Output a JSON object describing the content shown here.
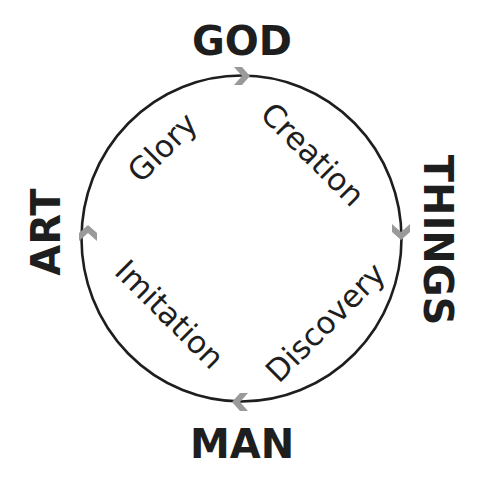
{
  "diagram": {
    "type": "cycle",
    "colors": {
      "line": "#1e1e1e",
      "arrow": "#9a9a9a",
      "text": "#1e1e1e",
      "background": "#ffffff"
    },
    "nodes": [
      {
        "id": "god",
        "label": "GOD",
        "position": "top"
      },
      {
        "id": "things",
        "label": "THINGS",
        "position": "right"
      },
      {
        "id": "man",
        "label": "MAN",
        "position": "bottom"
      },
      {
        "id": "art",
        "label": "ART",
        "position": "left"
      }
    ],
    "relations": [
      {
        "from": "god",
        "to": "things",
        "label": "Creation"
      },
      {
        "from": "things",
        "to": "man",
        "label": "Discovery"
      },
      {
        "from": "man",
        "to": "art",
        "label": "Imitation"
      },
      {
        "from": "art",
        "to": "god",
        "label": "Glory"
      }
    ],
    "arrows": [
      {
        "at": "top",
        "direction": "right"
      },
      {
        "at": "right",
        "direction": "down"
      },
      {
        "at": "bottom",
        "direction": "left"
      },
      {
        "at": "left",
        "direction": "up"
      }
    ]
  }
}
